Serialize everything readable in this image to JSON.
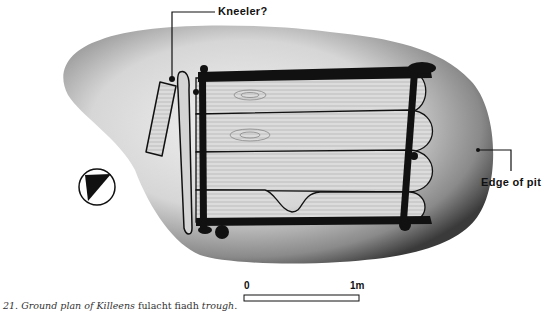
{
  "figure": {
    "number": "21.",
    "caption_parts": [
      {
        "text": "21. Ground plan of Killeens ",
        "style": "italic"
      },
      {
        "text": "fulacht fiadh",
        "style": "roman"
      },
      {
        "text": " trough.",
        "style": "italic"
      }
    ]
  },
  "labels": {
    "kneeler": "Kneeler?",
    "edge_of_pit": "Edge of pit"
  },
  "scale_bar": {
    "start_label": "0",
    "end_label": "1m"
  },
  "north_arrow": {
    "icon": "north-arrow-icon"
  },
  "colors": {
    "ink": "#111111",
    "pit_shade_dark": "#3a3a3a",
    "pit_shade_light": "#e6e6e6",
    "wood": "#d9d9d9",
    "background": "#ffffff"
  }
}
